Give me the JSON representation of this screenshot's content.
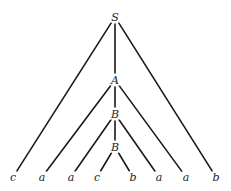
{
  "diagram": {
    "type": "parse-tree",
    "nodes": [
      {
        "id": "S",
        "label": "S",
        "x": 115,
        "y": 17
      },
      {
        "id": "A",
        "label": "A",
        "x": 115,
        "y": 80
      },
      {
        "id": "B1",
        "label": "B",
        "x": 115,
        "y": 114
      },
      {
        "id": "B2",
        "label": "B",
        "x": 115,
        "y": 147
      },
      {
        "id": "L1",
        "label": "c",
        "x": 13,
        "y": 177
      },
      {
        "id": "L2",
        "label": "a",
        "x": 42,
        "y": 177
      },
      {
        "id": "L3",
        "label": "a",
        "x": 71,
        "y": 177
      },
      {
        "id": "L4",
        "label": "c",
        "x": 97,
        "y": 177
      },
      {
        "id": "L5",
        "label": "b",
        "x": 133,
        "y": 177
      },
      {
        "id": "L6",
        "label": "a",
        "x": 159,
        "y": 177
      },
      {
        "id": "L7",
        "label": "a",
        "x": 186,
        "y": 177
      },
      {
        "id": "L8",
        "label": "b",
        "x": 216,
        "y": 177
      }
    ],
    "edges": [
      [
        "S",
        "L1"
      ],
      [
        "S",
        "A"
      ],
      [
        "S",
        "L8"
      ],
      [
        "A",
        "L2"
      ],
      [
        "A",
        "B1"
      ],
      [
        "A",
        "L7"
      ],
      [
        "B1",
        "L3"
      ],
      [
        "B1",
        "B2"
      ],
      [
        "B1",
        "L6"
      ],
      [
        "B2",
        "L4"
      ],
      [
        "B2",
        "L5"
      ]
    ],
    "leaf_string": "c a a c b a a b"
  }
}
